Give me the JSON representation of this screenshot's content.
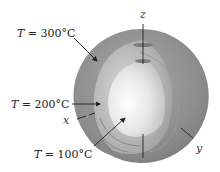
{
  "figure": {
    "labels": {
      "t300": {
        "var": "T",
        "eq": " = 300°C"
      },
      "t200": {
        "var": "T",
        "eq": " = 200°C"
      },
      "t100": {
        "var": "T",
        "eq": " = 100°C"
      }
    },
    "axes": {
      "x": "x",
      "y": "y",
      "z": "z"
    },
    "colors": {
      "outer_shell": "#8a8a8a",
      "middle_shell": "#b4b4b4",
      "inner_core": "#f0f0f0",
      "arrow": "#222222"
    }
  }
}
